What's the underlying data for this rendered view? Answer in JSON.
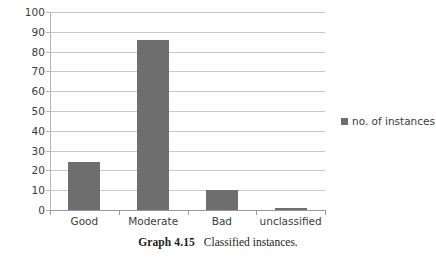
{
  "chart_data": {
    "type": "bar",
    "title": "",
    "subtitle": "",
    "xlabel": "",
    "ylabel": "",
    "categories": [
      "Good",
      "Moderate",
      "Bad",
      "unclassified"
    ],
    "values": [
      24,
      86,
      10,
      1
    ],
    "series": [
      {
        "name": "no. of instances",
        "values": [
          24,
          86,
          10,
          1
        ]
      }
    ],
    "ylim": [
      0,
      100
    ],
    "ytick_step": 10,
    "yticks": [
      100,
      90,
      80,
      70,
      60,
      50,
      40,
      30,
      20,
      10,
      0
    ],
    "ytick_labels": [
      "100",
      "90",
      "80",
      "70",
      "60",
      "50",
      "40",
      "30",
      "20",
      "10",
      "0"
    ],
    "grid": true,
    "grid_axis": "y",
    "legend": {
      "position": "right",
      "entries": [
        {
          "label": "no. of instances",
          "color": "#6e6e6e",
          "marker": "square"
        }
      ]
    },
    "bar_color": "#6e6e6e",
    "gridline_color": "#c9c9c9",
    "axis_color": "#9a9a9a",
    "text_color": "#3b3b3b",
    "background": "#ffffff"
  },
  "caption": {
    "label": "Graph 4.15",
    "text": "Classified instances."
  }
}
